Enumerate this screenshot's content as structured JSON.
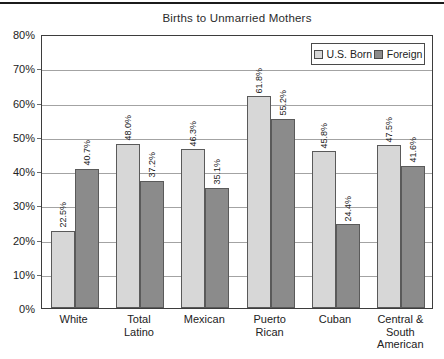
{
  "chart_data": {
    "type": "bar",
    "title": "Births to Unmarried Mothers",
    "categories": [
      "White",
      "Total Latino",
      "Mexican",
      "Puerto Rican",
      "Cuban",
      "Central & South American"
    ],
    "categories_display": [
      [
        "White"
      ],
      [
        "Total",
        "Latino"
      ],
      [
        "Mexican"
      ],
      [
        "Puerto",
        "Rican"
      ],
      [
        "Cuban"
      ],
      [
        "Central &",
        "South",
        "American"
      ]
    ],
    "series": [
      {
        "name": "U.S. Born",
        "color": "#d7d7d7",
        "values": [
          22.5,
          48.0,
          46.3,
          61.8,
          45.8,
          47.5
        ]
      },
      {
        "name": "Foreign",
        "color": "#8b8b8b",
        "values": [
          40.7,
          37.2,
          35.1,
          55.2,
          24.4,
          41.6
        ]
      }
    ],
    "value_labels": [
      [
        "22.5%",
        "48.0%",
        "46.3%",
        "61.8%",
        "45.8%",
        "47.5%"
      ],
      [
        "40.7%",
        "37.2%",
        "35.1%",
        "55.2%",
        "24.4%",
        "41.6%"
      ]
    ],
    "ylim": [
      0,
      80
    ],
    "ytick_step": 10,
    "ytick_labels": [
      "0%",
      "10%",
      "20%",
      "30%",
      "40%",
      "50%",
      "60%",
      "70%",
      "80%"
    ],
    "grid": true,
    "legend_position": "top-right",
    "colors": {
      "us_born_bar": "#d7d7d7",
      "foreign_bar": "#8b8b8b",
      "bar_border": "#5a5a5a",
      "gridline": "#a3a3a3",
      "frame": "#3d3d3d",
      "text": "#222222",
      "top_rule": "#1b1b1b"
    }
  }
}
